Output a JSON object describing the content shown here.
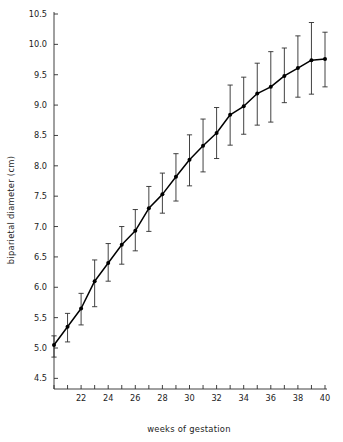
{
  "chart_data": {
    "type": "line",
    "title": "",
    "xlabel": "weeks of gestation",
    "ylabel": "biparietal diameter (cm)",
    "xlim": [
      20,
      40.5
    ],
    "ylim": [
      4.25,
      10.6
    ],
    "grid": false,
    "legend": null,
    "x": [
      20,
      21,
      22,
      23,
      24,
      25,
      26,
      27,
      28,
      29,
      30,
      31,
      32,
      33,
      34,
      35,
      36,
      37,
      38,
      39,
      40
    ],
    "values": [
      5.05,
      5.35,
      5.65,
      6.1,
      6.4,
      6.7,
      6.93,
      7.3,
      7.53,
      7.82,
      8.1,
      8.33,
      8.54,
      8.84,
      8.98,
      9.19,
      9.3,
      9.48,
      9.61,
      9.74,
      9.76
    ],
    "error_lower": [
      4.85,
      5.1,
      5.38,
      5.68,
      6.1,
      6.38,
      6.6,
      6.92,
      7.22,
      7.42,
      7.67,
      7.9,
      8.12,
      8.34,
      8.52,
      8.67,
      8.72,
      9.04,
      9.13,
      9.18,
      9.3
    ],
    "error_upper": [
      5.2,
      5.57,
      5.9,
      6.45,
      6.72,
      7.0,
      7.28,
      7.66,
      7.88,
      8.2,
      8.51,
      8.77,
      8.96,
      9.33,
      9.46,
      9.69,
      9.88,
      9.94,
      10.14,
      10.36,
      10.2
    ],
    "y_ticks": [
      4.5,
      5.0,
      5.5,
      6.0,
      6.5,
      7.0,
      7.5,
      8.0,
      8.5,
      9.0,
      9.5,
      10.0,
      10.5
    ],
    "y_tick_labels": [
      "4.5",
      "5.0",
      "5.5",
      "6.0",
      "6.5",
      "7.0",
      "7.5",
      "8.0",
      "8.5",
      "9.0",
      "9.5",
      "10.0",
      "10.5"
    ],
    "x_ticks": [
      20,
      21,
      22,
      23,
      24,
      25,
      26,
      27,
      28,
      29,
      30,
      31,
      32,
      33,
      34,
      35,
      36,
      37,
      38,
      39,
      40
    ],
    "x_tick_labels": [
      "",
      "",
      "22",
      "",
      "24",
      "",
      "26",
      "",
      "28",
      "",
      "30",
      "",
      "32",
      "",
      "34",
      "",
      "36",
      "",
      "38",
      "",
      "40"
    ],
    "colors": {
      "line": "#000000",
      "marker": "#000000",
      "error": "#2e2e2e",
      "axis": "#2b2b2b",
      "background": "#ffffff"
    }
  }
}
